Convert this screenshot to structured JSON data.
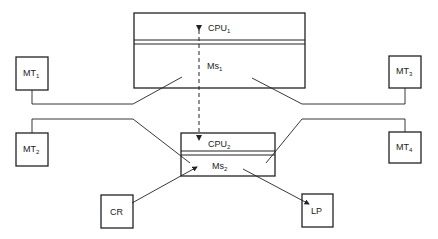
{
  "diagram": {
    "main_computer": {
      "cpu_label": "CPU",
      "cpu_sub": "1",
      "memory_label": "Ms",
      "memory_sub": "1"
    },
    "satellite_computer": {
      "cpu_label": "CPU",
      "cpu_sub": "2",
      "memory_label": "Ms",
      "memory_sub": "2"
    },
    "terminals": [
      {
        "id": "mt1",
        "label": "MT",
        "sub": "1"
      },
      {
        "id": "mt2",
        "label": "MT",
        "sub": "2"
      },
      {
        "id": "mt3",
        "label": "MT",
        "sub": "3"
      },
      {
        "id": "mt4",
        "label": "MT",
        "sub": "4"
      }
    ],
    "peripherals": [
      {
        "id": "cr",
        "label": "CR"
      },
      {
        "id": "lp",
        "label": "LP"
      }
    ],
    "colors": {
      "stroke": "#222222",
      "background": "#ffffff"
    }
  }
}
